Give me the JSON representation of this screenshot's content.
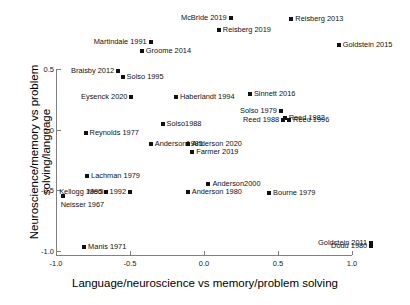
{
  "chart_data": {
    "type": "scatter",
    "title": "",
    "xlabel": "Language/neuroscience vs memory/problem solving",
    "ylabel": "Neuroscience/memory vs problem solving/language",
    "xlim": [
      -1.12,
      1.2
    ],
    "ylim": [
      -1.05,
      0.95
    ],
    "xticks": [
      "-1.0",
      "-0.5",
      "0.0",
      "0.5",
      "1.0"
    ],
    "xtick_values": [
      -1.0,
      -0.5,
      0.0,
      0.5,
      1.0
    ],
    "yticks": [
      "0.5",
      "0.0",
      "-0.5",
      "-1.0"
    ],
    "ytick_values": [
      0.5,
      0.0,
      -0.5,
      -1.0
    ],
    "grid": false,
    "legend": false,
    "marker": "square",
    "marker_color": "#111111",
    "points": [
      {
        "label": "McBride 2019",
        "x": 0.18,
        "y": 0.92,
        "side": "left"
      },
      {
        "label": "Reisberg 2013",
        "x": 0.59,
        "y": 0.91,
        "side": "right"
      },
      {
        "label": "Reisberg 2019",
        "x": 0.1,
        "y": 0.82,
        "side": "right"
      },
      {
        "label": "Martindale 1991",
        "x": -0.36,
        "y": 0.72,
        "side": "left"
      },
      {
        "label": "Goldstein 2015",
        "x": 0.91,
        "y": 0.7,
        "side": "right"
      },
      {
        "label": "Groome 2014",
        "x": -0.42,
        "y": 0.65,
        "side": "right"
      },
      {
        "label": "Braisby 2012",
        "x": -0.58,
        "y": 0.48,
        "side": "left"
      },
      {
        "label": "Solso 1995",
        "x": -0.55,
        "y": 0.43,
        "side": "right"
      },
      {
        "label": "Eysenck 2020",
        "x": -0.49,
        "y": 0.27,
        "side": "left"
      },
      {
        "label": "Haberlandt 1994",
        "x": -0.19,
        "y": 0.27,
        "side": "right"
      },
      {
        "label": "Sinnett 2016",
        "x": 0.31,
        "y": 0.29,
        "side": "right"
      },
      {
        "label": "Solso 1979",
        "x": 0.52,
        "y": 0.15,
        "side": "left"
      },
      {
        "label": "Reed 1982",
        "x": 0.545,
        "y": 0.1,
        "side": "right"
      },
      {
        "label": "Reed 1988",
        "x": 0.535,
        "y": 0.08,
        "side": "left"
      },
      {
        "label": "Reed 1996",
        "x": 0.575,
        "y": 0.08,
        "side": "right"
      },
      {
        "label": "Solso1988",
        "x": -0.28,
        "y": 0.05,
        "side": "right"
      },
      {
        "label": "Reynolds 1977",
        "x": -0.8,
        "y": -0.03,
        "side": "right"
      },
      {
        "label": "Anderson1985",
        "x": -0.36,
        "y": -0.12,
        "side": "right"
      },
      {
        "label": "Anderson 2020",
        "x": -0.11,
        "y": -0.12,
        "side": "right"
      },
      {
        "label": "Farmer 2019",
        "x": -0.08,
        "y": -0.18,
        "side": "right"
      },
      {
        "label": "Lachman 1979",
        "x": -0.79,
        "y": -0.38,
        "side": "right"
      },
      {
        "label": "Anderson2000",
        "x": 0.03,
        "y": -0.45,
        "side": "right"
      },
      {
        "label": "Kellogg 1995",
        "x": -0.66,
        "y": -0.51,
        "side": "left"
      },
      {
        "label": "Medin 1992",
        "x": -0.5,
        "y": -0.51,
        "side": "left"
      },
      {
        "label": "Anderson 1980",
        "x": -0.11,
        "y": -0.51,
        "side": "right"
      },
      {
        "label": "Bourne 1979",
        "x": 0.44,
        "y": -0.52,
        "side": "right"
      },
      {
        "label": "Neisser 1967",
        "x": -0.955,
        "y": -0.55,
        "side": "below"
      },
      {
        "label": "Goldstein 2011",
        "x": 1.13,
        "y": -0.93,
        "side": "left"
      },
      {
        "label": "Dodd 1980",
        "x": 1.13,
        "y": -0.96,
        "side": "left"
      },
      {
        "label": "Manis 1971",
        "x": -0.81,
        "y": -0.97,
        "side": "right"
      }
    ]
  }
}
